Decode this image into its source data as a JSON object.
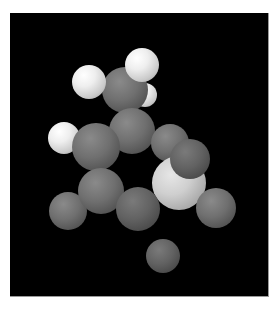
{
  "scene": {
    "description": "Space-filling (CPK) molecular model rendered in grayscale on black background",
    "background_color": "#000000",
    "page_color": "#ffffff",
    "viewport": {
      "x": 10,
      "y": 13,
      "width": 258,
      "height": 283
    }
  },
  "atoms": [
    {
      "name": "hydrogen-small-back",
      "tone": "white",
      "cx": 145,
      "cy": 95,
      "r": 12
    },
    {
      "name": "carbon-top",
      "tone": "gray",
      "cx": 125,
      "cy": 90,
      "r": 23
    },
    {
      "name": "hydrogen-top",
      "tone": "white",
      "cx": 142,
      "cy": 65,
      "r": 17
    },
    {
      "name": "hydrogen-left-top",
      "tone": "white",
      "cx": 89,
      "cy": 82,
      "r": 17
    },
    {
      "name": "carbon-center",
      "tone": "gray",
      "cx": 132,
      "cy": 131,
      "r": 23
    },
    {
      "name": "hydrogen-left-mid",
      "tone": "white",
      "cx": 64,
      "cy": 138,
      "r": 16
    },
    {
      "name": "carbon-left",
      "tone": "gray",
      "cx": 96,
      "cy": 147,
      "r": 24
    },
    {
      "name": "carbon-right",
      "tone": "gray",
      "cx": 170,
      "cy": 143,
      "r": 19
    },
    {
      "name": "atom-light-large",
      "tone": "light",
      "cx": 179,
      "cy": 183,
      "r": 27
    },
    {
      "name": "atom-right-front",
      "tone": "dark",
      "cx": 190,
      "cy": 159,
      "r": 20
    },
    {
      "name": "atom-far-right",
      "tone": "gray",
      "cx": 216,
      "cy": 208,
      "r": 20
    },
    {
      "name": "atom-far-left",
      "tone": "gray",
      "cx": 68,
      "cy": 211,
      "r": 19
    },
    {
      "name": "carbon-lower-left",
      "tone": "gray",
      "cx": 101,
      "cy": 191,
      "r": 23
    },
    {
      "name": "carbon-bottom-center",
      "tone": "dark",
      "cx": 138,
      "cy": 209,
      "r": 22
    },
    {
      "name": "atom-bottom",
      "tone": "dark",
      "cx": 163,
      "cy": 256,
      "r": 17
    }
  ]
}
